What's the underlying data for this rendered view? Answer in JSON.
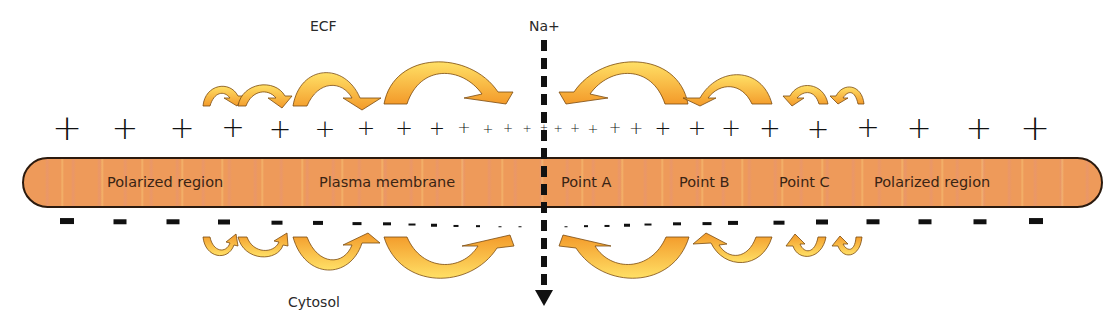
{
  "diagram": {
    "title_labels": {
      "ecf": "ECF",
      "ion": "Na+",
      "cytosol": "Cytosol"
    },
    "membrane_labels": [
      {
        "id": "polarized-left",
        "text": "Polarized region",
        "x": 107
      },
      {
        "id": "plasma-membrane",
        "text": "Plasma membrane",
        "x": 319
      },
      {
        "id": "point-a",
        "text": "Point A",
        "x": 561
      },
      {
        "id": "point-b",
        "text": "Point B",
        "x": 679
      },
      {
        "id": "point-c",
        "text": "Point C",
        "x": 779
      },
      {
        "id": "polarized-right",
        "text": "Polarized region",
        "x": 874
      }
    ],
    "colors": {
      "membrane_fill": "#ee9a5a",
      "membrane_border": "#2b1a0e",
      "arrow_light": "#ffd54a",
      "arrow_dark": "#f39a2a",
      "charge": "#111111"
    },
    "plus_charges": [
      {
        "x": 67,
        "size": 36
      },
      {
        "x": 125,
        "size": 32
      },
      {
        "x": 182,
        "size": 30
      },
      {
        "x": 233,
        "size": 28
      },
      {
        "x": 280,
        "size": 27
      },
      {
        "x": 325,
        "size": 25
      },
      {
        "x": 366,
        "size": 22
      },
      {
        "x": 404,
        "size": 21
      },
      {
        "x": 437,
        "size": 19
      },
      {
        "x": 464,
        "size": 16
      },
      {
        "x": 488,
        "size": 13
      },
      {
        "x": 508,
        "size": 12
      },
      {
        "x": 527,
        "size": 11
      },
      {
        "x": 544,
        "size": 10
      },
      {
        "x": 558,
        "size": 11
      },
      {
        "x": 575,
        "size": 12
      },
      {
        "x": 593,
        "size": 13
      },
      {
        "x": 615,
        "size": 15
      },
      {
        "x": 636,
        "size": 17
      },
      {
        "x": 663,
        "size": 20
      },
      {
        "x": 697,
        "size": 22
      },
      {
        "x": 731,
        "size": 24
      },
      {
        "x": 770,
        "size": 26
      },
      {
        "x": 818,
        "size": 27
      },
      {
        "x": 868,
        "size": 28
      },
      {
        "x": 919,
        "size": 30
      },
      {
        "x": 979,
        "size": 32
      },
      {
        "x": 1035,
        "size": 36
      }
    ],
    "minus_charges": [
      {
        "x": 67,
        "w": 14
      },
      {
        "x": 120,
        "w": 13
      },
      {
        "x": 173,
        "w": 13
      },
      {
        "x": 224,
        "w": 12
      },
      {
        "x": 277,
        "w": 11
      },
      {
        "x": 318,
        "w": 10
      },
      {
        "x": 357,
        "w": 9
      },
      {
        "x": 387,
        "w": 8
      },
      {
        "x": 412,
        "w": 7
      },
      {
        "x": 434,
        "w": 6
      },
      {
        "x": 456,
        "w": 5
      },
      {
        "x": 478,
        "w": 4
      },
      {
        "x": 500,
        "w": 3
      },
      {
        "x": 520,
        "w": 3
      },
      {
        "x": 566,
        "w": 3
      },
      {
        "x": 586,
        "w": 4
      },
      {
        "x": 607,
        "w": 5
      },
      {
        "x": 627,
        "w": 6
      },
      {
        "x": 648,
        "w": 7
      },
      {
        "x": 677,
        "w": 8
      },
      {
        "x": 707,
        "w": 9
      },
      {
        "x": 733,
        "w": 10
      },
      {
        "x": 779,
        "w": 11
      },
      {
        "x": 822,
        "w": 12
      },
      {
        "x": 873,
        "w": 13
      },
      {
        "x": 925,
        "w": 13
      },
      {
        "x": 980,
        "w": 13
      },
      {
        "x": 1036,
        "w": 14
      }
    ]
  }
}
